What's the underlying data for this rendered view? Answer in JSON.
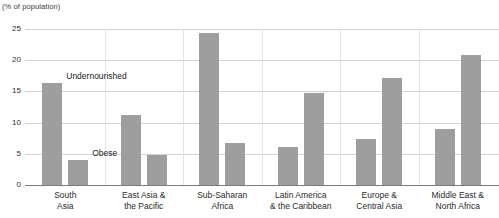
{
  "chart_data": {
    "type": "bar",
    "title": "",
    "subtitle": "",
    "unit_caption": "(% of population)",
    "xlabel": "",
    "ylabel": "",
    "ylim": [
      0,
      25
    ],
    "yticks": [
      0,
      5,
      10,
      15,
      20,
      25
    ],
    "grid": true,
    "legend_position": "inline-annotation",
    "categories": [
      "South Asia",
      "East Asia & the Pacific",
      "Sub-Saharan Africa",
      "Latin America & the Caribbean",
      "Europe & Central Asia",
      "Middle East & North Africa"
    ],
    "category_lines": [
      [
        "South",
        "Asia"
      ],
      [
        "East Asia &",
        "the Pacific"
      ],
      [
        "Sub-Saharan",
        "Africa"
      ],
      [
        "Latin America",
        "& the Caribbean"
      ],
      [
        "Europe &",
        "Central Asia"
      ],
      [
        "Middle East &",
        "North Africa"
      ]
    ],
    "series": [
      {
        "name": "Undernourished",
        "values": [
          16.3,
          11.3,
          24.3,
          6.1,
          7.4,
          8.9
        ]
      },
      {
        "name": "Obese",
        "values": [
          4.0,
          4.8,
          6.7,
          14.8,
          17.2,
          20.8
        ]
      }
    ],
    "annotations": [
      {
        "text": "Undernourished",
        "series": "Undernourished"
      },
      {
        "text": "Obese",
        "series": "Obese"
      }
    ],
    "colors": {
      "bar": "#9e9e9e",
      "gridline": "#d2d2d2",
      "baseline": "#7c7c7c",
      "text": "#2b2b2b",
      "background": "#ffffff"
    }
  }
}
